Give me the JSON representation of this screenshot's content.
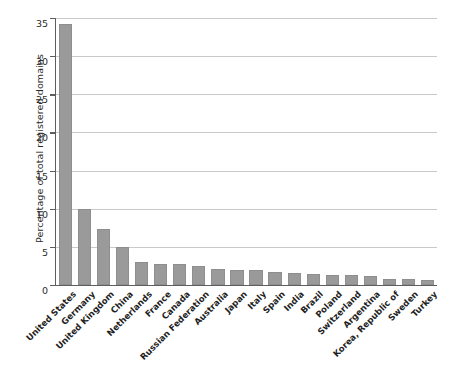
{
  "chart_data": {
    "type": "bar",
    "title": "",
    "subtitle": "",
    "xlabel": "",
    "ylabel": "Percentage of total registered domains",
    "ylim": [
      0,
      35
    ],
    "yticks": [
      0,
      5,
      10,
      15,
      20,
      25,
      30,
      35
    ],
    "ytick_labels": [
      "0",
      "5",
      "10",
      "15",
      "20",
      "25",
      "30",
      "35"
    ],
    "grid": true,
    "grid_axis": "y",
    "legend": false,
    "legend_position": "none",
    "bar_color": "#9a9a9a",
    "axis_color": "#5e5e5e",
    "grid_color": "#c9c9c9",
    "label_rotation": -45,
    "categories": [
      "United States",
      "Germany",
      "United Kingdom",
      "China",
      "Netherlands",
      "France",
      "Canada",
      "Russian Federation",
      "Australia",
      "Japan",
      "Italy",
      "Spain",
      "India",
      "Brazil",
      "Poland",
      "Switzerland",
      "Argentina",
      "Korea, Republic of",
      "Sweden",
      "Turkey"
    ],
    "values": [
      34.2,
      10.0,
      7.3,
      5.0,
      3.0,
      2.8,
      2.8,
      2.5,
      2.1,
      2.0,
      2.0,
      1.7,
      1.6,
      1.5,
      1.3,
      1.3,
      1.2,
      0.8,
      0.8,
      0.7
    ]
  }
}
